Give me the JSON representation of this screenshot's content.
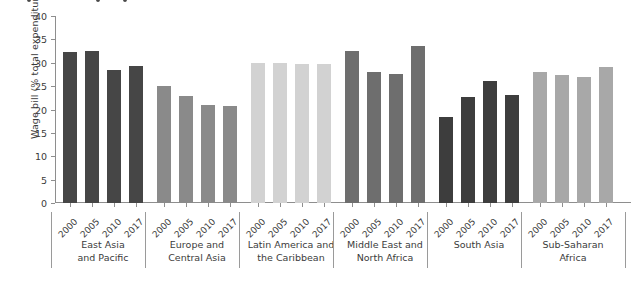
{
  "chart_data": {
    "type": "bar",
    "title": "",
    "xlabel": "",
    "ylabel": "Wage bill (% total expenditure)",
    "ylim": [
      0,
      40
    ],
    "ytick_values": [
      0,
      5,
      10,
      15,
      20,
      25,
      30,
      35,
      40
    ],
    "ytick_labels": [
      "0",
      "5",
      "10",
      "15",
      "20",
      "25",
      "30",
      "35",
      "40"
    ],
    "grid": false,
    "legend": "none",
    "categories": [
      "2000",
      "2005",
      "2010",
      "2017"
    ],
    "groups": [
      {
        "name": "East Asia\nand Pacific",
        "color": "#464646",
        "values": [
          32.2,
          32.5,
          28.4,
          29.3
        ]
      },
      {
        "name": "Europe and\nCentral Asia",
        "color": "#8a8a8a",
        "values": [
          25.1,
          22.9,
          21.0,
          20.8
        ]
      },
      {
        "name": "Latin America and\nthe Caribbean",
        "color": "#d2d2d2",
        "values": [
          29.9,
          29.9,
          29.7,
          29.7
        ]
      },
      {
        "name": "Middle East and\nNorth Africa",
        "color": "#6e6e6e",
        "values": [
          32.5,
          28.0,
          27.6,
          33.6
        ]
      },
      {
        "name": "South Asia",
        "color": "#3d3d3d",
        "values": [
          18.5,
          22.7,
          26.1,
          23.1
        ]
      },
      {
        "name": "Sub-Saharan\nAfrica",
        "color": "#a8a8a8",
        "values": [
          28.0,
          27.3,
          26.9,
          29.1
        ]
      }
    ]
  },
  "colors": {
    "axis": "#8e8e8e",
    "text": "#3b3b3b",
    "background": "#ffffff"
  }
}
